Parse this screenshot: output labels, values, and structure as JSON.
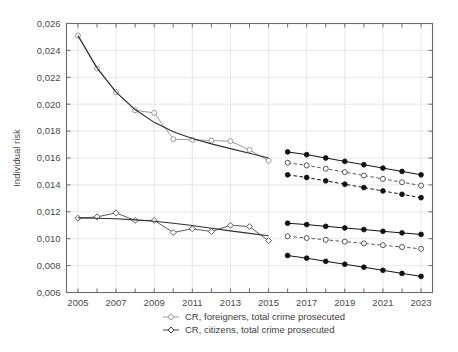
{
  "chart_data": {
    "type": "line",
    "title": "",
    "xlabel": "",
    "ylabel": "Individual risk",
    "xlim": [
      2004.4,
      2023.6
    ],
    "ylim": [
      0.006,
      0.026
    ],
    "ytick_step": 0.002,
    "ytick_labels": [
      "0,006",
      "0,008",
      "0,010",
      "0,012",
      "0,014",
      "0,016",
      "0,018",
      "0,020",
      "0,022",
      "0,024",
      "0,026"
    ],
    "ytick_values": [
      0.006,
      0.008,
      0.01,
      0.012,
      0.014,
      0.016,
      0.018,
      0.02,
      0.022,
      0.024,
      0.026
    ],
    "xtick_labels": [
      "2005",
      "2007",
      "2009",
      "2011",
      "2013",
      "2015",
      "2017",
      "2019",
      "2021",
      "2023"
    ],
    "xtick_values": [
      2005,
      2007,
      2009,
      2011,
      2013,
      2015,
      2017,
      2019,
      2021,
      2023
    ],
    "decimal_separator": ",",
    "grid": true,
    "legend_position": "below",
    "colors": {
      "foreigners": "#9a9a9a",
      "citizens": "#3a3a3a",
      "trend": "#2f2f2f",
      "axis": "#6a6a6a",
      "grid": "#dcdce4",
      "background": "#ffffff"
    },
    "series": [
      {
        "name": "CR, foreigners, total crime prosecuted",
        "role": "observed",
        "marker": "open-circle",
        "linestyle": "solid",
        "color": "#9a9a9a",
        "x": [
          2005,
          2006,
          2007,
          2008,
          2009,
          2010,
          2011,
          2012,
          2013,
          2014,
          2015
        ],
        "values": [
          0.0251,
          0.02265,
          0.0209,
          0.01955,
          0.01935,
          0.0174,
          0.01735,
          0.0173,
          0.01725,
          0.0166,
          0.0158
        ]
      },
      {
        "name": "foreigners trend",
        "role": "trend",
        "marker": "none",
        "linestyle": "solid",
        "color": "#2f2f2f",
        "x": [
          2005,
          2006,
          2007,
          2008,
          2009,
          2010,
          2011,
          2012,
          2013,
          2014,
          2015
        ],
        "values": [
          0.0251,
          0.0227,
          0.0209,
          0.0196,
          0.01865,
          0.01795,
          0.01745,
          0.01705,
          0.0167,
          0.01635,
          0.016
        ]
      },
      {
        "name": "CR, citizens, total crime prosecuted",
        "role": "observed",
        "marker": "open-diamond",
        "linestyle": "solid",
        "color": "#5c5c5c",
        "x": [
          2005,
          2006,
          2007,
          2008,
          2009,
          2010,
          2011,
          2012,
          2013,
          2014,
          2015
        ],
        "values": [
          0.01152,
          0.01162,
          0.01192,
          0.01136,
          0.01136,
          0.01046,
          0.01074,
          0.01053,
          0.011,
          0.0109,
          0.00985
        ]
      },
      {
        "name": "citizens trend",
        "role": "trend",
        "marker": "none",
        "linestyle": "solid",
        "color": "#2f2f2f",
        "x": [
          2005,
          2006,
          2007,
          2008,
          2009,
          2010,
          2011,
          2012,
          2013,
          2014,
          2015
        ],
        "values": [
          0.01155,
          0.01152,
          0.01148,
          0.0114,
          0.0113,
          0.01115,
          0.01098,
          0.01078,
          0.01058,
          0.0104,
          0.01022
        ]
      },
      {
        "name": "foreigners forecast upper",
        "role": "forecast-bound",
        "marker": "filled-circle",
        "linestyle": "solid",
        "color": "#111111",
        "x": [
          2016,
          2017,
          2018,
          2019,
          2020,
          2021,
          2022,
          2023
        ],
        "values": [
          0.01645,
          0.01625,
          0.016,
          0.01575,
          0.0155,
          0.01525,
          0.015,
          0.01475
        ]
      },
      {
        "name": "foreigners forecast mean",
        "role": "forecast-mean",
        "marker": "open-circle",
        "linestyle": "dashed",
        "color": "#555555",
        "x": [
          2016,
          2017,
          2018,
          2019,
          2020,
          2021,
          2022,
          2023
        ],
        "values": [
          0.01565,
          0.01545,
          0.0152,
          0.01495,
          0.0147,
          0.01445,
          0.0142,
          0.01395
        ]
      },
      {
        "name": "foreigners forecast lower",
        "role": "forecast-bound",
        "marker": "filled-circle",
        "linestyle": "dashed",
        "color": "#111111",
        "x": [
          2016,
          2017,
          2018,
          2019,
          2020,
          2021,
          2022,
          2023
        ],
        "values": [
          0.01475,
          0.01455,
          0.0143,
          0.01405,
          0.0138,
          0.01355,
          0.0133,
          0.01305
        ]
      },
      {
        "name": "citizens forecast upper",
        "role": "forecast-bound",
        "marker": "filled-circle",
        "linestyle": "solid",
        "color": "#111111",
        "x": [
          2016,
          2017,
          2018,
          2019,
          2020,
          2021,
          2022,
          2023
        ],
        "values": [
          0.01115,
          0.01105,
          0.01092,
          0.0108,
          0.01068,
          0.01055,
          0.01043,
          0.01032
        ]
      },
      {
        "name": "citizens forecast mean",
        "role": "forecast-mean",
        "marker": "open-circle",
        "linestyle": "dashed",
        "color": "#555555",
        "x": [
          2016,
          2017,
          2018,
          2019,
          2020,
          2021,
          2022,
          2023
        ],
        "values": [
          0.01018,
          0.01005,
          0.00992,
          0.00978,
          0.00965,
          0.00952,
          0.00938,
          0.00925
        ]
      },
      {
        "name": "citizens forecast lower",
        "role": "forecast-bound",
        "marker": "filled-circle",
        "linestyle": "solid",
        "color": "#111111",
        "x": [
          2016,
          2017,
          2018,
          2019,
          2020,
          2021,
          2022,
          2023
        ],
        "values": [
          0.00875,
          0.00855,
          0.00832,
          0.0081,
          0.00788,
          0.00765,
          0.00742,
          0.0072
        ]
      }
    ],
    "legend": [
      {
        "label": "CR, foreigners, total crime prosecuted",
        "marker": "open-circle",
        "color": "#9a9a9a"
      },
      {
        "label": "CR, citizens, total crime prosecuted",
        "marker": "open-diamond",
        "color": "#3a3a3a"
      }
    ]
  }
}
